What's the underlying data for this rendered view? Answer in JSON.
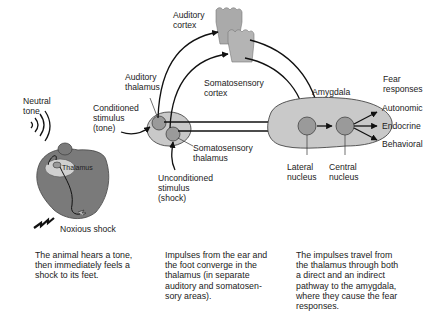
{
  "labels": {
    "neutral_tone": "Neutral\ntone",
    "auditory_cortex": "Auditory\ncortex",
    "somatosensory_cortex": "Somatosensory\ncortex",
    "auditory_thalamus": "Auditory\nthalamus",
    "conditioned_stimulus": "Conditioned\nstimulus\n(tone)",
    "somatosensory_thalamus": "Somatosensory\nthalamus",
    "unconditioned_stimulus": "Unconditioned\nstimulus\n(shock)",
    "amygdala": "Amygdala",
    "lateral_nucleus": "Lateral\nnucleus",
    "central_nucleus": "Central\nnucleus",
    "fear_responses": "Fear\nresponses",
    "thalamus_mouse": "Thalamus",
    "noxious_shock": "Noxious shock"
  },
  "fear_responses": [
    "Autonomic",
    "Endocrine",
    "Behavioral"
  ],
  "captions": [
    "The animal hears a tone,\nthen immediately feels a\nshock to its feet.",
    "Impulses from the ear and\nthe foot converge in the\nthalamus (in separate\nauditory and somatosen-\nsory areas).",
    "The impulses travel from\nthe thalamus through both\na direct and an indirect\npathway to the amygdala,\nwhere they cause the fear\nresponses."
  ],
  "colors": {
    "region_fill": "#c9c9c9",
    "nucleus_fill": "#9a9a9a",
    "mouse_fill": "#7a7a7a",
    "stroke": "#111111"
  }
}
